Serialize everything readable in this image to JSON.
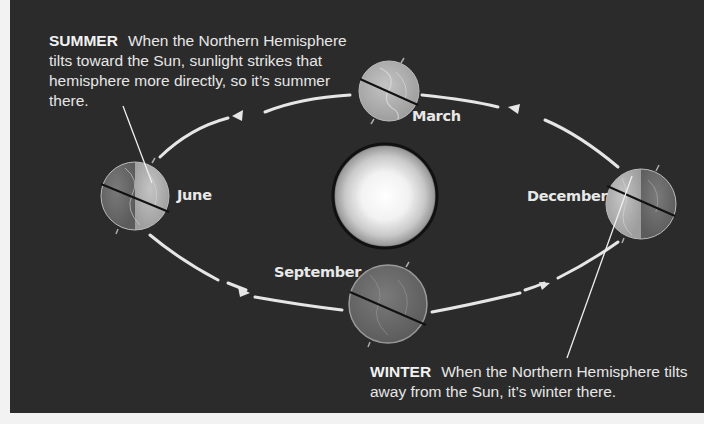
{
  "diagram": {
    "type": "earth-orbit-seasons",
    "background_color": "#2b2b2b",
    "sun": {
      "name": "Sun",
      "label": ""
    },
    "positions": [
      {
        "month": "March",
        "label": "March"
      },
      {
        "month": "June",
        "label": "June"
      },
      {
        "month": "September",
        "label": "September"
      },
      {
        "month": "December",
        "label": "December"
      }
    ],
    "orbit_direction": "counterclockwise (March → June → September → December)"
  },
  "captions": {
    "summer": {
      "heading": "SUMMER",
      "text": "When the Northern Hemisphere tilts toward the Sun, sunlight strikes that hemisphere more directly, so it’s summer there."
    },
    "winter": {
      "heading": "WINTER",
      "text": "When the Northern Hemisphere tilts away from the Sun, it’s winter there."
    }
  }
}
